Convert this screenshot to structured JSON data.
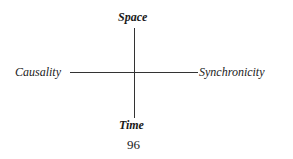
{
  "diagram": {
    "top_label": "Space",
    "bottom_label": "Time",
    "left_label": "Causality",
    "right_label": "Synchronicity"
  },
  "page_number": "96"
}
